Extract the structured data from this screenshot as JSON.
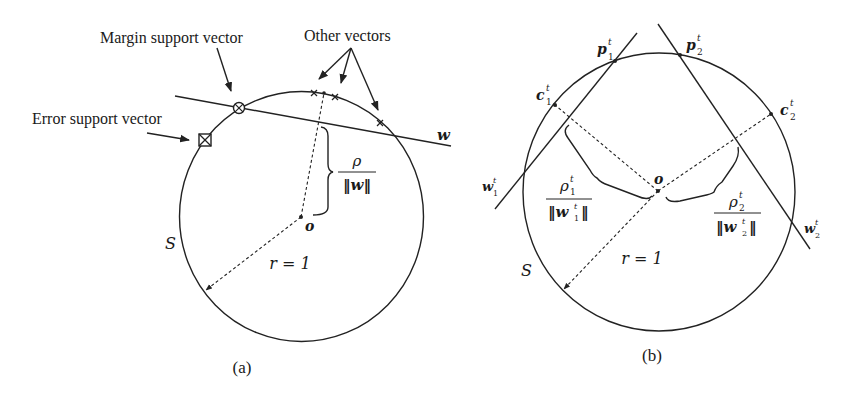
{
  "panel_a": {
    "caption": "(a)",
    "labels": {
      "margin_sv": "Margin support vector",
      "error_sv": "Error support vector",
      "other_vectors": "Other vectors",
      "hyperplane": "w",
      "origin": "o",
      "sphere": "S",
      "radius": "r = 1",
      "margin_num": "ρ",
      "margin_den": "‖w‖"
    }
  },
  "panel_b": {
    "caption": "(b)",
    "labels": {
      "p1": "p",
      "p1_sub": "1",
      "p2": "p",
      "p2_sub": "2",
      "c1": "c",
      "c1_sub": "1",
      "c2": "c",
      "c2_sub": "2",
      "w1": "w",
      "w1_sub": "1",
      "w2": "w",
      "w2_sub": "2",
      "sup": "t",
      "origin": "o",
      "sphere": "S",
      "radius": "r = 1",
      "rho1_num": "ρ",
      "rho1_sub": "1",
      "rho1_den": "‖w",
      "rho1_den_sub": "1",
      "rho1_den_end": "‖",
      "rho2_num": "ρ",
      "rho2_sub": "2",
      "rho2_den": "‖w",
      "rho2_den_sub": "2",
      "rho2_den_end": "‖"
    }
  },
  "colors": {
    "ink": "#222222",
    "background": "#ffffff"
  }
}
